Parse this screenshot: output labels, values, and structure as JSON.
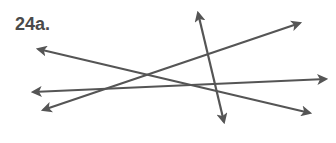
{
  "figure": {
    "label": "24a.",
    "line_color": "#555555",
    "lines": [
      {
        "name": "line-a",
        "x1": 38,
        "y1": 49,
        "x2": 310,
        "y2": 113,
        "arrow_start": true,
        "arrow_end": true
      },
      {
        "name": "line-b",
        "x1": 33,
        "y1": 92,
        "x2": 326,
        "y2": 79,
        "arrow_start": true,
        "arrow_end": true
      },
      {
        "name": "line-c",
        "x1": 43,
        "y1": 110,
        "x2": 300,
        "y2": 23,
        "arrow_start": true,
        "arrow_end": true
      },
      {
        "name": "line-d",
        "x1": 198,
        "y1": 13,
        "x2": 224,
        "y2": 122,
        "arrow_start": true,
        "arrow_end": true
      }
    ]
  }
}
